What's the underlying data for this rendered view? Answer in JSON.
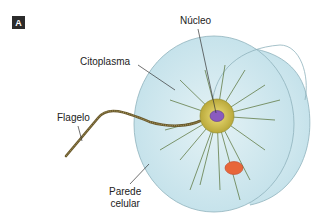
{
  "figure": {
    "panel_label": "A",
    "labels": {
      "nucleus": "Núcleo",
      "cytoplasm": "Citoplasma",
      "flagellum": "Flagelo",
      "cell_wall_line1": "Parede",
      "cell_wall_line2": "celular"
    },
    "colors": {
      "cell_fill": "#cfe8ef",
      "cell_outline": "#8fb3bd",
      "nucleus_ring": "#d8c84a",
      "nucleus_core": "#8a5bbf",
      "red_body": "#e8663a",
      "flagellum": "#6b5a2e",
      "cytoplasm_strands": "#4f6a2a",
      "leader_lines": "#333333"
    }
  }
}
